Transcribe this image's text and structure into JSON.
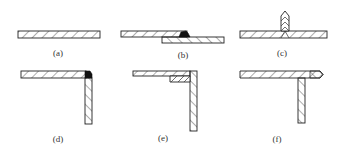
{
  "figure": {
    "ink_color": "#222222",
    "background": "#ffffff",
    "panels": [
      {
        "id": "a",
        "label": "(a)",
        "joint": "butt-joint"
      },
      {
        "id": "b",
        "label": "(b)",
        "joint": "lap-joint"
      },
      {
        "id": "c",
        "label": "(c)",
        "joint": "t-joint-double-bevel"
      },
      {
        "id": "d",
        "label": "(d)",
        "joint": "corner-joint-outside"
      },
      {
        "id": "e",
        "label": "(e)",
        "joint": "corner-joint-inside-fillet"
      },
      {
        "id": "f",
        "label": "(f)",
        "joint": "t-joint-offset"
      }
    ]
  }
}
